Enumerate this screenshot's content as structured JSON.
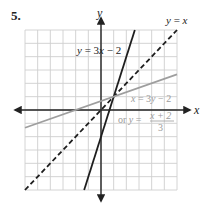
{
  "problem_number": "5.",
  "colors": {
    "grid": "#cfcfcf",
    "axis": "#222222",
    "line_dark": "#1e1e1e",
    "line_gray": "#9e9e9e",
    "label_gray": "#9a9a9a"
  },
  "chart_data": {
    "type": "line",
    "title": "",
    "xlabel": "x",
    "ylabel": "y",
    "xlim": [
      -6,
      6
    ],
    "ylim": [
      -6,
      6
    ],
    "grid": true,
    "grid_step": 1,
    "tick_labels_shown": false,
    "series": [
      {
        "name": "y = 3x - 2",
        "equation": "y = 3x - 2",
        "slope": 3,
        "intercept": -2,
        "style": "solid",
        "color": "dark",
        "points": [
          [
            -1.33,
            -6
          ],
          [
            2.67,
            6
          ]
        ]
      },
      {
        "name": "y = x",
        "equation": "y = x",
        "slope": 1,
        "intercept": 0,
        "style": "dashed",
        "color": "dark",
        "points": [
          [
            -6,
            -6
          ],
          [
            6,
            6
          ]
        ]
      },
      {
        "name": "x = 3y - 2",
        "equation": "x = 3y - 2",
        "alt_equation": "or y = (x + 2)/3",
        "slope": 0.3333,
        "intercept": 0.6667,
        "style": "solid",
        "color": "gray",
        "points": [
          [
            -6,
            -1.33
          ],
          [
            6,
            2.67
          ]
        ]
      }
    ],
    "annotations": {
      "label_line1": {
        "y": "y",
        "eq": " = 3",
        "x": "x",
        "rest": " − 2"
      },
      "label_identity": {
        "y": "y",
        "eq": " = ",
        "x": "x"
      },
      "label_inverse": {
        "x": "x",
        "eq": " = 3",
        "y": "y",
        "rest": " − 2"
      },
      "label_inverse_alt_prefix": "or ",
      "label_inverse_alt_y": "y",
      "label_inverse_alt_eq": " = ",
      "label_inverse_alt_num": "x + 2",
      "label_inverse_alt_den": "3"
    },
    "intersection_point": [
      1,
      1
    ]
  }
}
